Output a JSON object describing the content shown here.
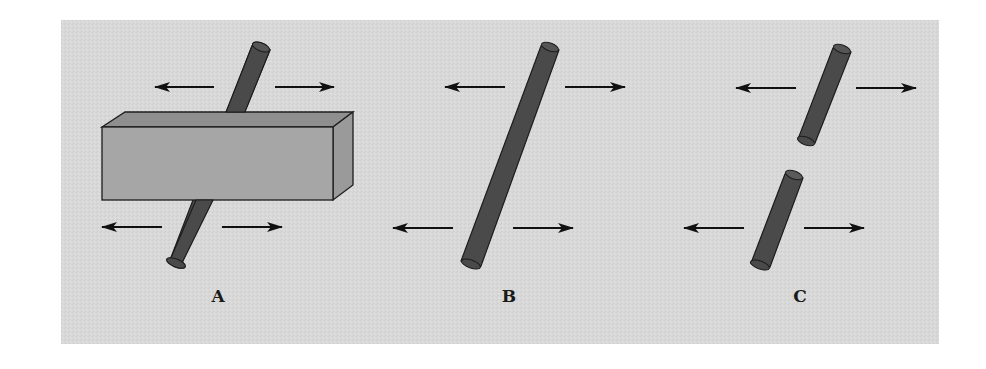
{
  "figure": {
    "colors": {
      "panel_background": "#d9d9d9",
      "block_front": "#a6a6a6",
      "block_top": "#8f8f8f",
      "block_side": "#9a9a9a",
      "block_edge": "#1e1e1e",
      "rod_fill": "#4a4a4a",
      "rod_edge": "#1c1c1c",
      "arrow": "#111111"
    },
    "panels": [
      {
        "id": "A",
        "label": "A",
        "elements": [
          "rod-through-block",
          "block",
          "4 arrows pointing outward"
        ]
      },
      {
        "id": "B",
        "label": "B",
        "elements": [
          "single-rod",
          "4 arrows pointing outward"
        ]
      },
      {
        "id": "C",
        "label": "C",
        "elements": [
          "broken-rod-upper",
          "broken-rod-lower",
          "4 arrows pointing outward"
        ]
      }
    ]
  }
}
